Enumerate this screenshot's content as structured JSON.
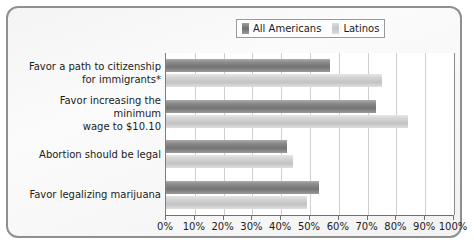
{
  "chart_data": {
    "type": "bar",
    "orientation": "horizontal",
    "title": "",
    "xlabel": "",
    "ylabel": "",
    "xlim": [
      0,
      100
    ],
    "xtick_labels": [
      "0%",
      "10%",
      "20%",
      "30%",
      "40%",
      "50%",
      "60%",
      "70%",
      "80%",
      "90%",
      "100%"
    ],
    "xtick_values": [
      0,
      10,
      20,
      30,
      40,
      50,
      60,
      70,
      80,
      90,
      100
    ],
    "grid": true,
    "legend_position": "top-right",
    "categories": [
      "Favor a path to citizenship\nfor immigrants*",
      "Favor increasing the minimum\nwage to $10.10",
      "Abortion should be legal",
      "Favor legalizing marijuana"
    ],
    "series": [
      {
        "name": "All Americans",
        "color": "#8e8e8e",
        "values": [
          57,
          73,
          42,
          53
        ]
      },
      {
        "name": "Latinos",
        "color": "#d2d2d2",
        "values": [
          75,
          84,
          44,
          49
        ]
      }
    ]
  },
  "legend": {
    "entries": [
      {
        "label": "All Americans"
      },
      {
        "label": "Latinos"
      }
    ]
  }
}
